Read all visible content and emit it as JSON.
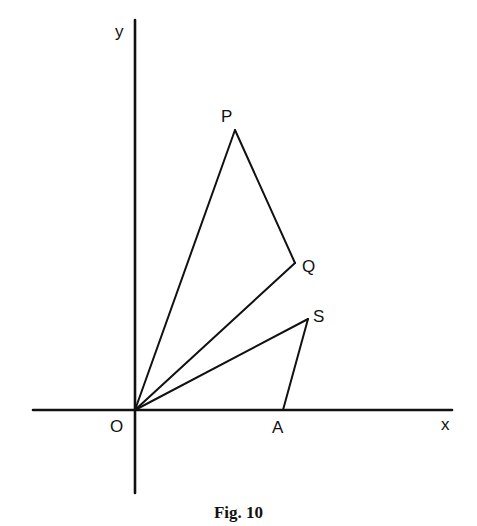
{
  "figure": {
    "caption": "Fig. 10",
    "axes": {
      "x_label": "x",
      "y_label": "y",
      "origin_label": "O"
    },
    "points": {
      "O": {
        "label": "O",
        "x": 135,
        "y": 410
      },
      "P": {
        "label": "P",
        "x": 235,
        "y": 130
      },
      "Q": {
        "label": "Q",
        "x": 295,
        "y": 263
      },
      "S": {
        "label": "S",
        "x": 308,
        "y": 319
      },
      "A": {
        "label": "A",
        "x": 283,
        "y": 410
      }
    },
    "segments": [
      [
        "O",
        "P"
      ],
      [
        "P",
        "Q"
      ],
      [
        "O",
        "Q"
      ],
      [
        "O",
        "S"
      ],
      [
        "S",
        "A"
      ]
    ],
    "colors": {
      "ink": "#111111",
      "background": "#ffffff"
    }
  }
}
